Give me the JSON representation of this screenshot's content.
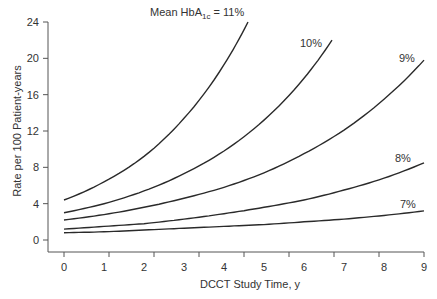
{
  "chart_data": {
    "type": "line",
    "title": "",
    "xlabel": "DCCT Study Time, y",
    "ylabel": "Rate per 100 Patient-years",
    "xlim": [
      0,
      9
    ],
    "ylim": [
      0,
      24
    ],
    "x_ticks": [
      0,
      1,
      2,
      3,
      4,
      5,
      6,
      7,
      8,
      9
    ],
    "y_ticks": [
      0,
      4,
      8,
      12,
      16,
      20,
      24
    ],
    "grid": false,
    "legend": "inline labels at curve ends",
    "annotation": "Mean HbA1c = 11%",
    "series": [
      {
        "name": "11%",
        "label": "Mean HbA1c = 11%",
        "x": [
          0,
          1,
          2,
          3,
          4,
          4.6
        ],
        "values": [
          4.4,
          6.4,
          9.2,
          13.4,
          19.3,
          24.0
        ]
      },
      {
        "name": "10%",
        "label": "10%",
        "x": [
          0,
          1,
          2,
          3,
          4,
          5,
          6,
          6.7
        ],
        "values": [
          3.0,
          4.0,
          5.4,
          7.3,
          9.8,
          13.2,
          17.8,
          22.0
        ]
      },
      {
        "name": "9%",
        "label": "9%",
        "x": [
          0,
          1,
          2,
          3,
          4,
          5,
          6,
          7,
          8,
          9
        ],
        "values": [
          2.2,
          2.8,
          3.6,
          4.6,
          5.8,
          7.4,
          9.5,
          12.1,
          15.5,
          19.8
        ]
      },
      {
        "name": "8%",
        "label": "8%",
        "x": [
          0,
          1,
          2,
          3,
          4,
          5,
          6,
          7,
          8,
          9
        ],
        "values": [
          1.2,
          1.5,
          1.8,
          2.3,
          2.9,
          3.6,
          4.4,
          5.5,
          6.8,
          8.5
        ]
      },
      {
        "name": "7%",
        "label": "7%",
        "x": [
          0,
          1,
          2,
          3,
          4,
          5,
          6,
          7,
          8,
          9
        ],
        "values": [
          0.8,
          0.9,
          1.1,
          1.3,
          1.5,
          1.7,
          2.0,
          2.3,
          2.7,
          3.2
        ]
      }
    ]
  },
  "labels": {
    "annotation_prefix": "Mean HbA",
    "annotation_sub": "1c",
    "annotation_suffix": " = 11%",
    "label_10": "10%",
    "label_9": "9%",
    "label_8": "8%",
    "label_7": "7%",
    "xlabel": "DCCT Study Time, y",
    "ylabel": "Rate per 100 Patient-years"
  }
}
